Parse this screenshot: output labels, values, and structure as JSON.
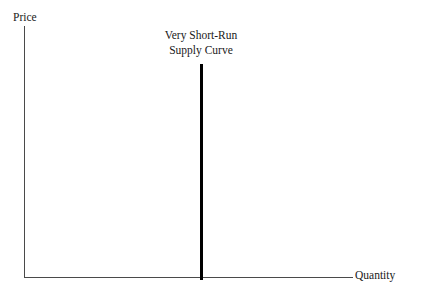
{
  "chart_data": {
    "type": "line",
    "title": "",
    "xlabel": "Quantity",
    "ylabel": "Price",
    "grid": false,
    "legend": "none",
    "axis_color": "#4a4a4a",
    "curve_color": "#000000",
    "background": "#ffffff",
    "annotations": [
      {
        "name": "very-short-run-supply-curve",
        "line1": "Very Short-Run",
        "line2": "Supply Curve",
        "position": "above-curve-centered"
      }
    ],
    "series": [
      {
        "name": "Very Short-Run Supply Curve",
        "shape": "vertical",
        "description": "Perfectly inelastic supply: quantity fixed at a single value for all prices",
        "x": [
          0.54,
          0.54
        ],
        "y": [
          0.0,
          0.85
        ]
      }
    ],
    "xlim": [
      0,
      1
    ],
    "ylim": [
      0,
      1
    ],
    "xticks": [],
    "yticks": []
  },
  "axes": {
    "y_title": "Price",
    "x_title": "Quantity"
  },
  "annotation": {
    "line1": "Very Short-Run",
    "line2": "Supply Curve"
  }
}
